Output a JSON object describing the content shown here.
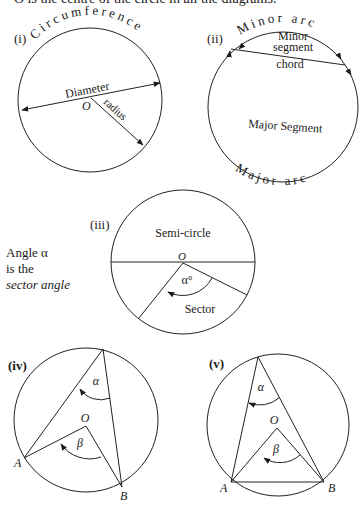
{
  "caption": "O is the centre of the circle in all the diagrams.",
  "diagrams": {
    "i": {
      "label": "(i)",
      "circumference": "Circumference",
      "diameter": "Diameter",
      "radius": "radius",
      "centre": "O"
    },
    "ii": {
      "label": "(ii)",
      "minor_arc": "Minor   arc",
      "minor_segment_1": "Minor",
      "minor_segment_2": "segment",
      "chord": "chord",
      "major_segment": "Major Segment",
      "major_arc": "Major   arc"
    },
    "iii": {
      "label": "(iii)",
      "semi_circle": "Semi-circle",
      "centre": "O",
      "angle": "α°",
      "sector": "Sector"
    },
    "iv": {
      "label": "(iv)",
      "alpha": "α",
      "beta": "β",
      "centre": "O",
      "point_a": "A",
      "point_b": "B"
    },
    "v": {
      "label": "(v)",
      "alpha": "α",
      "beta": "β",
      "centre": "O",
      "point_a": "A",
      "point_b": "B"
    }
  },
  "side_note": {
    "line1": "Angle α",
    "line2": "is the",
    "line3": "sector angle"
  }
}
